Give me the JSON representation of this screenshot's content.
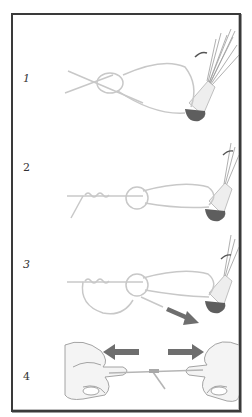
{
  "diagram": {
    "frame_color": "#3a3a3a",
    "line_color": "#bdbdbd",
    "arrow_color": "#6e6e6e",
    "lure_head_color": "#5a5a5a",
    "steps": [
      {
        "number": "1",
        "description": "overhand knot tied in line, tag passed through lure eye forming loop"
      },
      {
        "number": "2",
        "description": "tag end wrapped around standing line"
      },
      {
        "number": "3",
        "description": "tag end passed back through overhand knot, arrow indicates pull direction"
      },
      {
        "number": "4",
        "description": "hands pull line in opposite directions to tighten knot"
      }
    ]
  }
}
